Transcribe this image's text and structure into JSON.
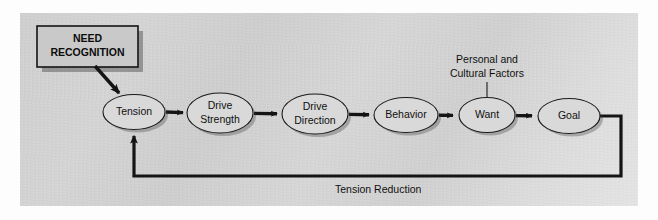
{
  "figure": {
    "title_text": "",
    "panel_background": "#d4d4d4",
    "ink_color": "#141414",
    "node_fill": "#d9d9d9"
  },
  "source_box": {
    "line1": "NEED",
    "line2": "RECOGNITION"
  },
  "nodes": [
    {
      "id": "tension",
      "label_line1": "Tension",
      "label_line2": "",
      "cx": 134,
      "cy": 112,
      "rx": 31,
      "ry": 17.5
    },
    {
      "id": "drive-strength",
      "label_line1": "Drive",
      "label_line2": "Strength",
      "cx": 220,
      "cy": 113,
      "rx": 33,
      "ry": 20
    },
    {
      "id": "drive-direction",
      "label_line1": "Drive",
      "label_line2": "Direction",
      "cx": 315,
      "cy": 114,
      "rx": 33,
      "ry": 20
    },
    {
      "id": "behavior",
      "label_line1": "Behavior",
      "label_line2": "",
      "cx": 406,
      "cy": 115,
      "rx": 32,
      "ry": 17.5
    },
    {
      "id": "want",
      "label_line1": "Want",
      "label_line2": "",
      "cx": 487,
      "cy": 115,
      "rx": 28,
      "ry": 17.5
    },
    {
      "id": "goal",
      "label_line1": "Goal",
      "label_line2": "",
      "cx": 569,
      "cy": 116,
      "rx": 31,
      "ry": 17.5
    }
  ],
  "annotation": {
    "line1": "Personal and",
    "line2": "Cultural Factors"
  },
  "feedback": {
    "label": "Tension Reduction"
  }
}
